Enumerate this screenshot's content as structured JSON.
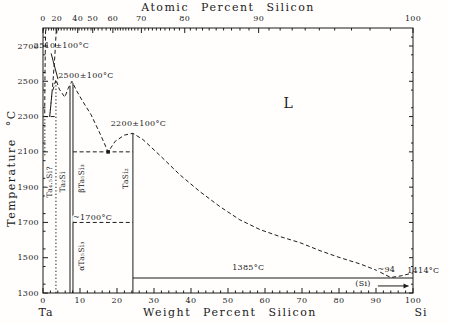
{
  "figure": {
    "ink": "#1b1b1b",
    "background": "#fffefd"
  },
  "chart_data": {
    "type": "line",
    "top_axis": {
      "title": "Atomic Percent Silicon",
      "major_ticks": [
        0,
        20,
        40,
        50,
        60,
        70,
        80,
        90,
        100
      ]
    },
    "bottom_axis": {
      "title": "Weight Percent Silicon",
      "left_label": "Ta",
      "right_label": "Si",
      "range": [
        0,
        100
      ],
      "major_ticks": [
        0,
        10,
        20,
        30,
        40,
        50,
        60,
        70,
        80,
        90,
        100
      ]
    },
    "y_axis": {
      "title": "Temperature °C",
      "range": [
        1300,
        2800
      ],
      "major_ticks": [
        1300,
        1500,
        1700,
        1900,
        2100,
        2300,
        2500,
        2700
      ]
    },
    "curves": [
      {
        "name": "liquidus-ta-side",
        "style": "dash",
        "points": [
          [
            3.6,
            2790
          ],
          [
            3.2,
            2640
          ],
          [
            2.7,
            2500
          ],
          [
            2.2,
            2380
          ],
          [
            1.8,
            2300
          ]
        ]
      },
      {
        "name": "solidus-ta-side",
        "style": "dash",
        "points": [
          [
            0.7,
            2790
          ],
          [
            0.55,
            2550
          ],
          [
            0.45,
            2302
          ]
        ]
      },
      {
        "name": "liquidus-main",
        "style": "dash",
        "points": [
          [
            1.8,
            2300
          ],
          [
            2.4,
            2430
          ],
          [
            3.5,
            2510
          ],
          [
            4.4,
            2455
          ],
          [
            5.9,
            2410
          ],
          [
            6.8,
            2460
          ],
          [
            7.8,
            2500
          ],
          [
            9,
            2450
          ],
          [
            10.5,
            2395
          ],
          [
            13,
            2310
          ],
          [
            15.5,
            2200
          ],
          [
            17.6,
            2100
          ],
          [
            19.5,
            2160
          ],
          [
            22,
            2195
          ],
          [
            24.3,
            2205
          ],
          [
            27,
            2170
          ],
          [
            31.6,
            2080
          ],
          [
            37,
            1970
          ],
          [
            42.4,
            1875
          ],
          [
            47.8,
            1790
          ],
          [
            53.2,
            1715
          ],
          [
            58.6,
            1660
          ],
          [
            64,
            1620
          ],
          [
            69.5,
            1585
          ],
          [
            74.9,
            1540
          ],
          [
            80.3,
            1500
          ],
          [
            85.7,
            1465
          ],
          [
            90,
            1430
          ],
          [
            94,
            1388
          ],
          [
            97,
            1398
          ],
          [
            100,
            1414
          ]
        ]
      }
    ],
    "horizontal_lines": [
      {
        "name": "eutectic-2300",
        "T": 2300,
        "wt1": 0.3,
        "wt2": 3.5,
        "style": "dash"
      },
      {
        "name": "eutectic-2100",
        "T": 2100,
        "wt1": 8.1,
        "wt2": 24.3,
        "style": "dash"
      },
      {
        "name": "transform-1700",
        "T": 1700,
        "wt1": 8.1,
        "wt2": 24.3,
        "style": "dash"
      },
      {
        "name": "eutectic-1385",
        "T": 1385,
        "wt1": 24.3,
        "wt2": 100,
        "style": "solid"
      }
    ],
    "vertical_lines": [
      {
        "name": "ta-solvus",
        "wt": 0.5,
        "T1": 2080,
        "T2": 2300,
        "style": "dot"
      },
      {
        "name": "Ta4.5Si-line",
        "wt": 3.5,
        "T1": 1300,
        "T2": 2505,
        "style": "dot"
      },
      {
        "name": "Ta2Si-line",
        "wt": 7.3,
        "T1": 1300,
        "T2": 2475,
        "style": "solid"
      },
      {
        "name": "Ta5Si3-line",
        "wt": 8.1,
        "T1": 1300,
        "T2": 2490,
        "style": "solid"
      },
      {
        "name": "TaSi2-line",
        "wt": 24.3,
        "T1": 1300,
        "T2": 2205,
        "style": "solid"
      }
    ],
    "eutectic_marker": {
      "wt": 17.6,
      "T": 2100
    },
    "phase_labels": [
      {
        "text": "Ta₄.₅Si?",
        "wt": 1.7,
        "T": 1930
      },
      {
        "text": "Ta₂Si",
        "wt": 5.3,
        "T": 1930
      },
      {
        "text": "βTa₅Si₃",
        "wt": 10.4,
        "T": 1950
      },
      {
        "text": "αTa₅Si₃",
        "wt": 10.4,
        "T": 1510
      },
      {
        "text": "TaSi₂",
        "wt": 22.3,
        "T": 1950
      }
    ],
    "annotations": [
      {
        "name": "melt-2510",
        "text": "2510±100°C",
        "wt": 5.0,
        "T": 2690,
        "leader": [
          [
            2.2,
            2658
          ],
          [
            4.05,
            2512
          ]
        ]
      },
      {
        "name": "melt-2500",
        "text": "2500±100°C",
        "wt": 11.6,
        "T": 2520
      },
      {
        "name": "melt-2200",
        "text": "2200±100°C",
        "wt": 25.8,
        "T": 2245
      },
      {
        "name": "transform-temp",
        "text": "~1700°C",
        "wt": 13.4,
        "T": 1715,
        "halo": true
      },
      {
        "name": "eutectic-temp-1385",
        "text": "1385°C",
        "wt": 55.5,
        "T": 1430
      },
      {
        "name": "si-melting",
        "text": "1414°C",
        "wt": 102.8,
        "T": 1415
      },
      {
        "name": "eutectic-comp-94",
        "text": "~94",
        "wt": 92.8,
        "T": 1420,
        "halo": true
      },
      {
        "name": "si-phase",
        "text": "(Si)",
        "wt": 86.5,
        "T": 1340,
        "arrow": [
          [
            90.5,
            1340
          ],
          [
            98.8,
            1340
          ]
        ]
      },
      {
        "name": "liquid-region",
        "text": "L",
        "wt": 66.3,
        "T": 2350,
        "size": 14
      }
    ]
  }
}
